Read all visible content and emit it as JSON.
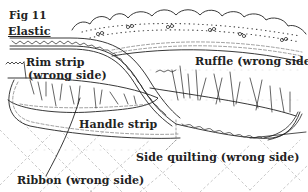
{
  "figure": {
    "title": "Fig 11",
    "labels": {
      "elastic": "Elastic",
      "rim_strip_line1": "Rim strip",
      "rim_strip_line2": "(wrong side)",
      "ruffle": "Ruffle (wrong side)",
      "handle_strip": "Handle strip",
      "side_quilting": "Side quilting (wrong side)",
      "ribbon": "Ribbon (wrong side)"
    },
    "colors": {
      "ink": "#222222",
      "dash": "#777777",
      "quilt": "#bbbbbb",
      "background": "#ffffff"
    }
  }
}
